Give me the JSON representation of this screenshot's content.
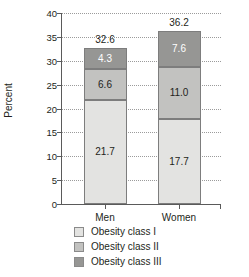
{
  "chart_data": {
    "type": "bar",
    "subtype": "stacked-vertical",
    "title": "",
    "xlabel": "",
    "ylabel": "Percent",
    "ylim": [
      0,
      40
    ],
    "yticks": [
      0,
      5,
      10,
      15,
      20,
      25,
      30,
      35,
      40
    ],
    "ytick_labels": [
      "0",
      "5",
      "10",
      "15",
      "20",
      "25",
      "30",
      "35",
      "40"
    ],
    "grid": "horizontal-dotted",
    "legend_position": "bottom-center",
    "categories": [
      "Men",
      "Women"
    ],
    "series": [
      {
        "name": "Obesity class I",
        "color": "#e3e3e1",
        "values": [
          21.7,
          17.7
        ],
        "label_color": "#231f20"
      },
      {
        "name": "Obesity class II",
        "color": "#c2c2c0",
        "values": [
          6.6,
          11.0
        ],
        "label_color": "#231f20"
      },
      {
        "name": "Obesity class III",
        "color": "#969694",
        "values": [
          4.3,
          7.6
        ],
        "label_color": "#ffffff"
      }
    ],
    "totals": [
      32.6,
      36.2
    ],
    "value_labels": {
      "Men": {
        "class_i": "21.7",
        "class_ii": "6.6",
        "class_iii": "4.3",
        "total": "32.6"
      },
      "Women": {
        "class_i": "17.7",
        "class_ii": "11.0",
        "class_iii": "7.6",
        "total": "36.2"
      }
    }
  },
  "axis": {
    "y_title": "Percent"
  },
  "legend": {
    "items": [
      {
        "label": "Obesity class I"
      },
      {
        "label": "Obesity class II"
      },
      {
        "label": "Obesity class III"
      }
    ]
  }
}
